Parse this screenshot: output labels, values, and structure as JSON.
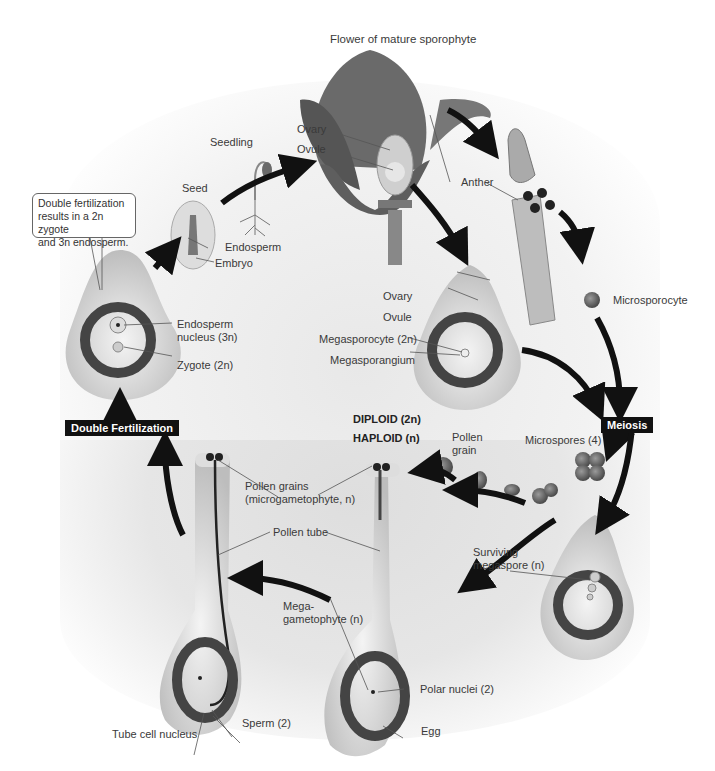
{
  "title": "Flower of mature sporophyte",
  "callout": {
    "line1": "Double fertilization",
    "line2": "results in a 2n zygote",
    "line3": "and 3n endosperm."
  },
  "labels": {
    "seedling": "Seedling",
    "seed": "Seed",
    "endosperm": "Endosperm",
    "embryo": "Embryo",
    "flower_ovary": "Ovary",
    "flower_ovule": "Ovule",
    "anther": "Anther",
    "microsporocyte": "Microsporocyte",
    "ovary": "Ovary",
    "ovule": "Ovule",
    "megasporocyte": "Megasporocyte (2n)",
    "megasporangium": "Megasporangium",
    "endosperm_nucleus_1": "Endosperm",
    "endosperm_nucleus_2": "nucleus (3n)",
    "zygote": "Zygote (2n)",
    "diploid": "DIPLOID (2n)",
    "haploid": "HAPLOID (n)",
    "pollen_grain_1": "Pollen",
    "pollen_grain_2": "grain",
    "microspores": "Microspores (4)",
    "pollen_grains_1": "Pollen grains",
    "pollen_grains_2": "(microgametophyte, n)",
    "pollen_tube": "Pollen tube",
    "surviving_1": "Surviving",
    "surviving_2": "megaspore (n)",
    "megagametophyte_1": "Mega-",
    "megagametophyte_2": "gametophyte (n)",
    "polar_nuclei": "Polar nuclei (2)",
    "egg": "Egg",
    "sperm": "Sperm (2)",
    "tube_cell_nucleus": "Tube cell nucleus"
  },
  "stages": {
    "meiosis": "Meiosis",
    "double_fertilization": "Double Fertilization"
  },
  "colors": {
    "arrow": "#111111",
    "tissue_dark": "#4a4a4a",
    "tissue_light": "#d6d6d6",
    "stage_box": "#111111"
  }
}
